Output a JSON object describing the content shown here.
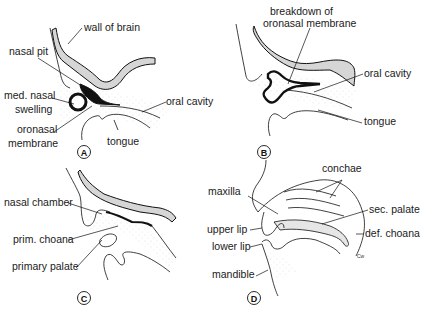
{
  "figure": {
    "colors": {
      "line": "#111111",
      "brain_fill": "#d6d6d6",
      "stipple": "#bbbbbb",
      "background": "#ffffff"
    },
    "panels": [
      {
        "id": "A",
        "label": "A",
        "annotations": [
          {
            "text": "wall of brain"
          },
          {
            "text": "nasal pit"
          },
          {
            "text": "med. nasal"
          },
          {
            "text": "swelling"
          },
          {
            "text": "oral cavity"
          },
          {
            "text": "oronasal"
          },
          {
            "text": "membrane"
          },
          {
            "text": "tongue"
          }
        ]
      },
      {
        "id": "B",
        "label": "B",
        "annotations": [
          {
            "text": "breakdown  of"
          },
          {
            "text": "oronasal membrane"
          },
          {
            "text": "oral cavity"
          },
          {
            "text": "tongue"
          }
        ]
      },
      {
        "id": "C",
        "label": "C",
        "annotations": [
          {
            "text": "nasal chamber"
          },
          {
            "text": "prim. choana"
          },
          {
            "text": "primary palate"
          }
        ]
      },
      {
        "id": "D",
        "label": "D",
        "annotations": [
          {
            "text": "conchae"
          },
          {
            "text": "maxilla"
          },
          {
            "text": "sec. palate"
          },
          {
            "text": "upper lip"
          },
          {
            "text": "def. choana"
          },
          {
            "text": "lower lip"
          },
          {
            "text": "mandible"
          }
        ],
        "signature": "Cw"
      }
    ]
  }
}
